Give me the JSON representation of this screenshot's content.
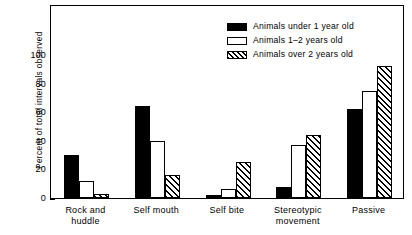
{
  "chart_data": {
    "type": "bar",
    "title": "",
    "xlabel": "",
    "ylabel": "Percent of total intervals observed",
    "ylim": [
      0,
      100
    ],
    "yticks": [
      0,
      20,
      40,
      60,
      80,
      100
    ],
    "ytick_labels": [
      "0",
      "20",
      "40",
      "60",
      "80",
      "100"
    ],
    "grid": false,
    "legend_position": "top-right",
    "categories": [
      "Rock and\nhuddle",
      "Self mouth",
      "Self bite",
      "Stereotypic\nmovement",
      "Passive"
    ],
    "series": [
      {
        "name": "Animals under 1 year old",
        "fill": "solid",
        "color": "#000000",
        "values": [
          30,
          64,
          2,
          8,
          62
        ]
      },
      {
        "name": "Animals 1–2 years old",
        "fill": "open",
        "color": "#ffffff",
        "values": [
          12,
          40,
          6,
          37,
          75
        ]
      },
      {
        "name": "Animals over 2 years old",
        "fill": "hatch",
        "color": "#ffffff",
        "values": [
          3,
          16,
          25,
          44,
          92
        ]
      }
    ]
  },
  "legend": {
    "items": [
      {
        "label": "Animals under 1 year old",
        "swatch": "solid-swatch"
      },
      {
        "label": "Animals 1–2 years old",
        "swatch": "open-swatch"
      },
      {
        "label": "Animals over 2 years old",
        "swatch": "hatched-swatch"
      }
    ]
  }
}
